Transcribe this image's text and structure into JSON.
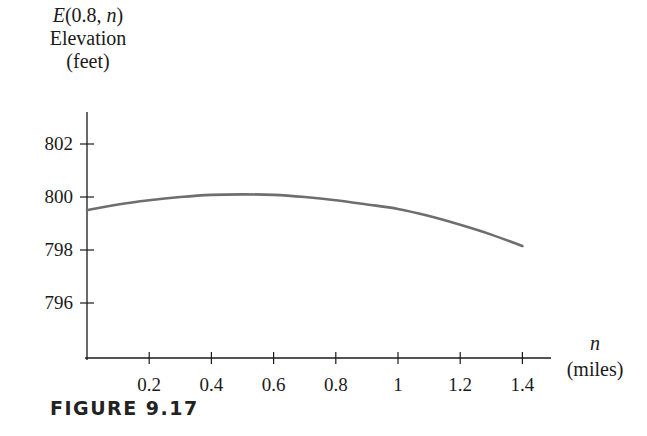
{
  "figure": {
    "caption": "FIGURE 9.17"
  },
  "axes": {
    "y_label_function": "E(0.8, n)",
    "y_label_function_parts": {
      "name": "E",
      "open": "(0.8, ",
      "var": "n",
      "close": ")"
    },
    "y_label_quantity": "Elevation",
    "y_label_units": "(feet)",
    "x_label_var": "n",
    "x_label_units": "(miles)"
  },
  "colors": {
    "curve": "#6e6e6e",
    "axis": "#1a1a1a",
    "background": "#ffffff"
  },
  "chart_data": {
    "type": "line",
    "title": "",
    "xlabel": "n (miles)",
    "ylabel": "E(0.8, n) Elevation (feet)",
    "x_ticks": [
      "0.2",
      "0.4",
      "0.6",
      "0.8",
      "1",
      "1.2",
      "1.4"
    ],
    "y_ticks": [
      "796",
      "798",
      "800",
      "802"
    ],
    "xlim": [
      0,
      1.5
    ],
    "ylim": [
      795,
      803
    ],
    "grid": false,
    "legend": null,
    "series": [
      {
        "name": "E(0.8, n)",
        "x": [
          0,
          0.1,
          0.2,
          0.3,
          0.4,
          0.5,
          0.6,
          0.7,
          0.8,
          0.9,
          1.0,
          1.1,
          1.2,
          1.3,
          1.4
        ],
        "y": [
          799.5,
          799.72,
          799.88,
          800.0,
          800.08,
          800.1,
          800.08,
          800.0,
          799.88,
          799.72,
          799.55,
          799.28,
          798.95,
          798.58,
          798.15
        ]
      }
    ],
    "caption": "FIGURE 9.17"
  }
}
